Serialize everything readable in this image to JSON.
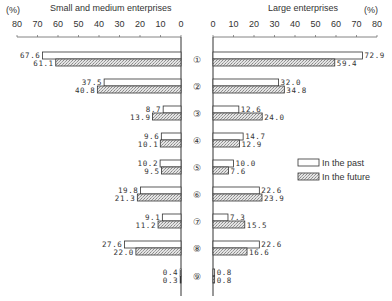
{
  "chart_data": [
    {
      "type": "bar",
      "orientation": "horizontal",
      "title": "Small and medium enterprises",
      "unit": "(%)",
      "xlim": [
        0,
        80
      ],
      "x_direction": "reversed",
      "ticks": [
        80,
        70,
        60,
        50,
        40,
        30,
        20,
        10,
        0
      ],
      "categories": [
        "①",
        "②",
        "③",
        "④",
        "⑤",
        "⑥",
        "⑦",
        "⑧",
        "⑨"
      ],
      "series": [
        {
          "name": "In the past",
          "values": [
            67.6,
            37.5,
            8.7,
            9.6,
            10.2,
            19.8,
            9.1,
            27.6,
            0.4
          ]
        },
        {
          "name": "In the future",
          "values": [
            61.1,
            40.8,
            13.9,
            10.1,
            9.5,
            21.3,
            11.2,
            22.0,
            0.3
          ]
        }
      ],
      "labels": {
        "past": [
          "67.6",
          "37.5",
          "8.7",
          "9.6",
          "10.2",
          "19.8",
          "9.1",
          "27.6",
          "0.4"
        ],
        "future": [
          "61.1",
          "40.8",
          "13.9",
          "10.1",
          "9.5",
          "21.3",
          "11.2",
          "22.0",
          "0.3"
        ]
      }
    },
    {
      "type": "bar",
      "orientation": "horizontal",
      "title": "Large enterprises",
      "unit": "(%)",
      "xlim": [
        0,
        80
      ],
      "ticks": [
        0,
        10,
        20,
        30,
        40,
        50,
        60,
        70,
        80
      ],
      "categories": [
        "①",
        "②",
        "③",
        "④",
        "⑤",
        "⑥",
        "⑦",
        "⑧",
        "⑨"
      ],
      "series": [
        {
          "name": "In the past",
          "values": [
            72.9,
            32.0,
            12.6,
            14.7,
            10.0,
            22.6,
            7.3,
            22.6,
            0.8
          ]
        },
        {
          "name": "In the future",
          "values": [
            59.4,
            34.8,
            24.0,
            12.9,
            7.6,
            23.9,
            15.5,
            16.6,
            0.8
          ]
        }
      ],
      "labels": {
        "past": [
          "72.9",
          "32.0",
          "12.6",
          "14.7",
          "10.0",
          "22.6",
          "7.3",
          "22.6",
          "0.8"
        ],
        "future": [
          "59.4",
          "34.8",
          "24.0",
          "12.9",
          "7.6",
          "23.9",
          "15.5",
          "16.6",
          "0.8"
        ]
      }
    }
  ],
  "legend": {
    "past": "In the past",
    "future": "In the future"
  },
  "header": {
    "left_unit": "(%)",
    "left_title": "Small and medium enterprises",
    "right_title": "Large enterprises",
    "right_unit": "(%)"
  }
}
